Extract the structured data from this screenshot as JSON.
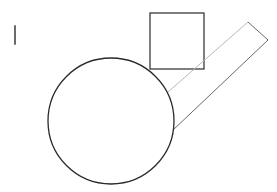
{
  "canvas": {
    "width": 277,
    "height": 192,
    "background": "#ffffff"
  },
  "colors": {
    "stroke": "#2a2a2a",
    "faint_stroke": "#b8b8b8",
    "mid_stroke": "#6a6a6a"
  },
  "shapes": {
    "mark": {
      "x1": 15,
      "y1": 26,
      "x2": 15,
      "y2": 44
    },
    "square": {
      "x": 150,
      "y": 13,
      "width": 54,
      "height": 56
    },
    "circle": {
      "cx": 111,
      "cy": 121,
      "r": 63
    },
    "rectangle": {
      "points": [
        [
          168,
          92
        ],
        [
          248,
          22
        ],
        [
          268,
          40
        ],
        [
          172,
          131
        ]
      ]
    }
  }
}
